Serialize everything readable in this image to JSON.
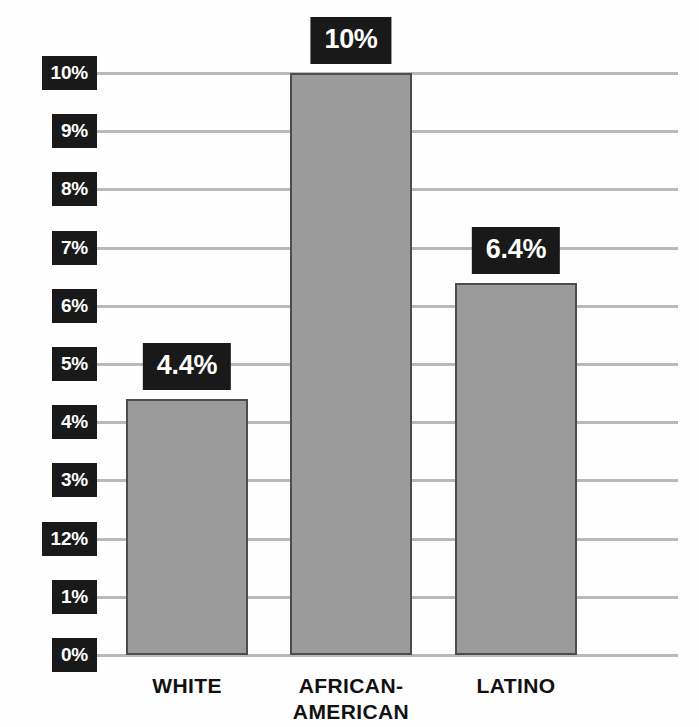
{
  "chart_data": {
    "type": "bar",
    "title": "",
    "subtitle": "",
    "xlabel": "",
    "ylabel": "",
    "categories": [
      "WHITE",
      "AFRICAN-\nAMERICAN",
      "LATINO"
    ],
    "values": [
      4.4,
      10,
      6.4
    ],
    "value_labels": [
      "4.4%",
      "10%",
      "6.4%"
    ],
    "ylim": [
      0,
      10
    ],
    "grid": true,
    "legend": false,
    "legend_position": "none",
    "y_tick_labels": [
      "10%",
      "9%",
      "8%",
      "7%",
      "6%",
      "5%",
      "4%",
      "3%",
      "12%",
      "1%",
      "0%"
    ],
    "y_tick_values": [
      10,
      9,
      8,
      7,
      6,
      5,
      4,
      3,
      2,
      1,
      0
    ],
    "colors": {
      "bar_fill": "#9b9b9b",
      "bar_outline": "#4d4d4d",
      "gridline": "#b9b9b9",
      "chip_background": "#191919",
      "chip_text": "#ffffff",
      "category_text": "#111111",
      "background": "#fefefe"
    }
  }
}
